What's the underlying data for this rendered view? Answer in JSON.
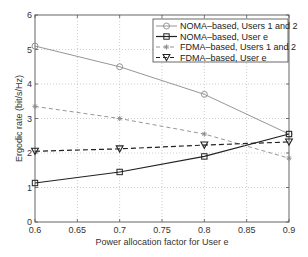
{
  "chart_data": {
    "type": "line",
    "title": "",
    "xlabel": "Power allocation factor for User e",
    "ylabel": "Ergodic rate (bit/s/Hz)",
    "xlim": [
      0.6,
      0.9
    ],
    "ylim": [
      0,
      6
    ],
    "xticks": [
      "0.6",
      "0.65",
      "0.7",
      "0.75",
      "0.8",
      "0.85",
      "0.9"
    ],
    "yticks": [
      "0",
      "1",
      "2",
      "3",
      "4",
      "5",
      "6"
    ],
    "grid": true,
    "legend_position": "upper right",
    "x": [
      0.6,
      0.7,
      0.8,
      0.9
    ],
    "series": [
      {
        "name": "NOMA–based, Users 1 and 2",
        "values": [
          5.1,
          4.5,
          3.7,
          2.55
        ],
        "marker": "circle",
        "line": "solid",
        "color": "#8a8a8a"
      },
      {
        "name": "NOMA–based, User e",
        "values": [
          1.13,
          1.45,
          1.9,
          2.55
        ],
        "marker": "square",
        "line": "solid",
        "color": "#222222"
      },
      {
        "name": "FDMA–based, Users 1 and 2",
        "values": [
          3.35,
          3.0,
          2.55,
          1.85
        ],
        "marker": "star",
        "line": "dashed",
        "color": "#8a8a8a"
      },
      {
        "name": "FDMA–based, User e",
        "values": [
          2.05,
          2.12,
          2.23,
          2.32
        ],
        "marker": "triangle-down",
        "line": "dashed",
        "color": "#222222"
      }
    ]
  }
}
